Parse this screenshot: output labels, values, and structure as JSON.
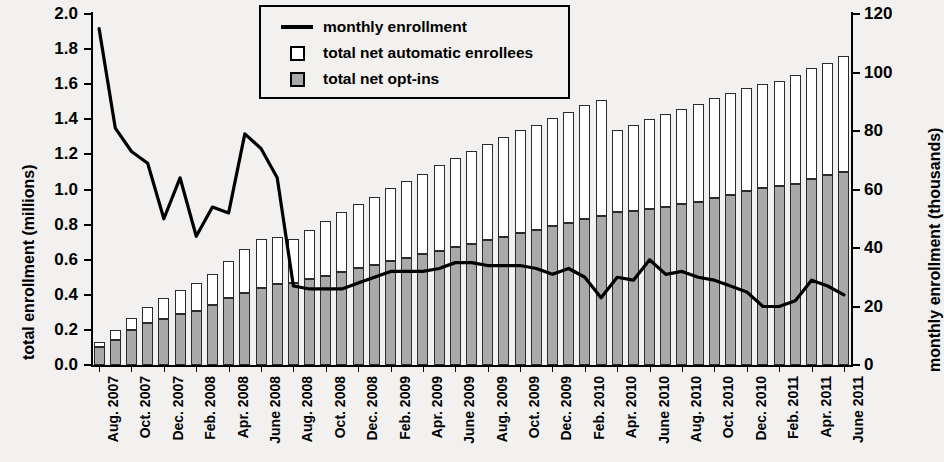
{
  "chart_data": {
    "type": "bar",
    "title": "",
    "subtitle": "",
    "xlabel": "",
    "ylabel": "total enrollment (millions)",
    "y2label": "monthly enrollment (thousands)",
    "grid": false,
    "legend_position": "top-center",
    "ylim": [
      0.0,
      2.0
    ],
    "y2lim": [
      0,
      120
    ],
    "ytick_labels": [
      "2.0",
      "1.8",
      "1.6",
      "1.4",
      "1.2",
      "1.0",
      "0.8",
      "0.6",
      "0.4",
      "0.2",
      "0.0"
    ],
    "ytick_values": [
      2.0,
      1.8,
      1.6,
      1.4,
      1.2,
      1.0,
      0.8,
      0.6,
      0.4,
      0.2,
      0.0
    ],
    "y2tick_labels": [
      "120",
      "100",
      "80",
      "60",
      "40",
      "20",
      "0"
    ],
    "y2tick_values": [
      120,
      100,
      80,
      60,
      40,
      20,
      0
    ],
    "xtick_labels": [
      "Aug. 2007",
      "Oct. 2007",
      "Dec. 2007",
      "Feb. 2008",
      "Apr. 2008",
      "June 2008",
      "Aug. 2008",
      "Oct. 2008",
      "Dec. 2008",
      "Feb. 2009",
      "Apr. 2009",
      "June 2009",
      "Aug. 2009",
      "Oct. 2009",
      "Dec. 2009",
      "Feb. 2010",
      "Apr. 2010",
      "June 2010",
      "Aug. 2010",
      "Oct. 2010",
      "Dec. 2010",
      "Feb. 2011",
      "Apr. 2011",
      "June 2011"
    ],
    "xtick_every_n_categories": 2,
    "categories": [
      "Aug. 2007",
      "Sep. 2007",
      "Oct. 2007",
      "Nov. 2007",
      "Dec. 2007",
      "Jan. 2008",
      "Feb. 2008",
      "Mar. 2008",
      "Apr. 2008",
      "May 2008",
      "June 2008",
      "July 2008",
      "Aug. 2008",
      "Sep. 2008",
      "Oct. 2008",
      "Nov. 2008",
      "Dec. 2008",
      "Jan. 2009",
      "Feb. 2009",
      "Mar. 2009",
      "Apr. 2009",
      "May 2009",
      "June 2009",
      "July 2009",
      "Aug. 2009",
      "Sep. 2009",
      "Oct. 2009",
      "Nov. 2009",
      "Dec. 2009",
      "Jan. 2010",
      "Feb. 2010",
      "Mar. 2010",
      "Apr. 2010",
      "May 2010",
      "June 2010",
      "July 2010",
      "Aug. 2010",
      "Sep. 2010",
      "Oct. 2010",
      "Nov. 2010",
      "Dec. 2010",
      "Jan. 2011",
      "Feb. 2011",
      "Mar. 2011",
      "Apr. 2011",
      "May 2011",
      "June 2011"
    ],
    "series": [
      {
        "name": "total net opt-ins",
        "axis": "left",
        "kind": "bar-stack-bottom",
        "color": "#a9a9a9",
        "values": [
          0.1,
          0.14,
          0.2,
          0.24,
          0.26,
          0.29,
          0.31,
          0.34,
          0.38,
          0.41,
          0.44,
          0.46,
          0.47,
          0.49,
          0.51,
          0.53,
          0.55,
          0.57,
          0.59,
          0.61,
          0.63,
          0.65,
          0.67,
          0.69,
          0.71,
          0.73,
          0.75,
          0.77,
          0.79,
          0.81,
          0.83,
          0.85,
          0.87,
          0.88,
          0.89,
          0.9,
          0.92,
          0.93,
          0.95,
          0.97,
          0.99,
          1.01,
          1.02,
          1.03,
          1.06,
          1.08,
          1.1
        ]
      },
      {
        "name": "total net automatic enrollees",
        "axis": "left",
        "kind": "bar-stack-top",
        "color": "#ffffff",
        "values": [
          0.03,
          0.06,
          0.07,
          0.09,
          0.12,
          0.14,
          0.16,
          0.18,
          0.21,
          0.25,
          0.28,
          0.27,
          0.25,
          0.28,
          0.31,
          0.34,
          0.37,
          0.39,
          0.42,
          0.44,
          0.46,
          0.49,
          0.51,
          0.53,
          0.55,
          0.57,
          0.59,
          0.6,
          0.62,
          0.63,
          0.65,
          0.66,
          0.47,
          0.49,
          0.51,
          0.53,
          0.54,
          0.56,
          0.57,
          0.58,
          0.59,
          0.59,
          0.6,
          0.62,
          0.63,
          0.64,
          0.66
        ]
      },
      {
        "name": "monthly enrollment",
        "axis": "right",
        "kind": "line",
        "color": "#000000",
        "values": [
          115,
          81,
          73,
          69,
          50,
          64,
          44,
          54,
          52,
          79,
          74,
          64,
          27,
          26,
          26,
          26,
          28,
          30,
          32,
          32,
          32,
          33,
          35,
          35,
          34,
          34,
          34,
          33,
          31,
          33,
          30,
          23,
          30,
          29,
          36,
          31,
          32,
          30,
          29,
          27,
          25,
          20,
          20,
          22,
          29,
          27,
          24
        ]
      }
    ],
    "stacked_totals": [
      0.13,
      0.2,
      0.27,
      0.33,
      0.38,
      0.43,
      0.47,
      0.52,
      0.59,
      0.66,
      0.72,
      0.73,
      0.72,
      0.77,
      0.82,
      0.87,
      0.92,
      0.96,
      1.01,
      1.05,
      1.09,
      1.14,
      1.18,
      1.22,
      1.26,
      1.3,
      1.34,
      1.37,
      1.41,
      1.44,
      1.48,
      1.51,
      1.34,
      1.37,
      1.4,
      1.43,
      1.46,
      1.49,
      1.52,
      1.55,
      1.58,
      1.6,
      1.62,
      1.65,
      1.69,
      1.72,
      1.76
    ]
  },
  "legend": {
    "items": [
      {
        "label": "monthly enrollment",
        "key": "line-key",
        "color": "#000000"
      },
      {
        "label": "total net automatic enrollees",
        "key": "white-box-key",
        "color": "#ffffff"
      },
      {
        "label": "total net opt-ins",
        "key": "gray-box-key",
        "color": "#a9a9a9"
      }
    ]
  }
}
